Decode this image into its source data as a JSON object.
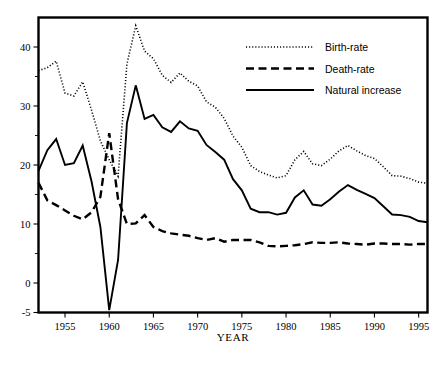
{
  "chart_data": {
    "type": "line",
    "title": "",
    "xlabel": "YEAR",
    "ylabel": "",
    "xlim": [
      1952,
      1996
    ],
    "ylim": [
      -5,
      45
    ],
    "grid": false,
    "legend_position": "top-right",
    "x": [
      1952,
      1953,
      1954,
      1955,
      1956,
      1957,
      1958,
      1959,
      1960,
      1961,
      1962,
      1963,
      1964,
      1965,
      1966,
      1967,
      1968,
      1969,
      1970,
      1971,
      1972,
      1973,
      1974,
      1975,
      1976,
      1977,
      1978,
      1979,
      1980,
      1981,
      1982,
      1983,
      1984,
      1985,
      1986,
      1987,
      1988,
      1989,
      1990,
      1991,
      1992,
      1993,
      1994,
      1995,
      1996
    ],
    "x_ticks": [
      1955,
      1960,
      1965,
      1970,
      1975,
      1980,
      1985,
      1990,
      1995
    ],
    "x_tick_labels": [
      "1955",
      "1960",
      "1965",
      "1970",
      "1975",
      "1980",
      "1985",
      "1990",
      "1995"
    ],
    "y_ticks_major": [
      40,
      30,
      20,
      10,
      0,
      -5
    ],
    "y_tick_labels": [
      "40",
      "30",
      "20",
      "10",
      "0",
      "-5"
    ],
    "y_ticks_minor": [
      35,
      25,
      15,
      5
    ],
    "series": [
      {
        "name": "Birth-rate",
        "style": "dotted",
        "values": [
          36.0,
          36.5,
          37.6,
          32.2,
          31.7,
          34.1,
          29.3,
          24.1,
          20.9,
          18.1,
          37.1,
          43.6,
          39.3,
          38.0,
          35.2,
          34.0,
          35.6,
          34.2,
          33.4,
          30.7,
          29.8,
          27.9,
          24.9,
          23.0,
          19.9,
          18.9,
          18.3,
          17.8,
          18.2,
          20.9,
          22.3,
          20.2,
          19.9,
          21.0,
          22.4,
          23.3,
          22.4,
          21.6,
          21.1,
          19.7,
          18.2,
          18.1,
          17.7,
          17.1,
          16.9
        ]
      },
      {
        "name": "Death-rate",
        "style": "dashed",
        "values": [
          17.0,
          14.0,
          13.2,
          12.3,
          11.4,
          10.8,
          12.0,
          14.6,
          25.4,
          14.2,
          10.0,
          10.1,
          11.5,
          9.5,
          8.8,
          8.4,
          8.2,
          8.0,
          7.6,
          7.3,
          7.6,
          7.0,
          7.3,
          7.3,
          7.3,
          6.9,
          6.3,
          6.2,
          6.3,
          6.4,
          6.6,
          6.9,
          6.8,
          6.8,
          6.9,
          6.7,
          6.6,
          6.5,
          6.7,
          6.7,
          6.6,
          6.6,
          6.5,
          6.6,
          6.6
        ]
      },
      {
        "name": "Natural increase",
        "style": "solid",
        "values": [
          19.0,
          22.5,
          24.4,
          20.0,
          20.3,
          23.3,
          17.2,
          9.5,
          -4.6,
          3.9,
          27.1,
          33.5,
          27.8,
          28.5,
          26.4,
          25.6,
          27.4,
          26.2,
          25.8,
          23.4,
          22.2,
          20.9,
          17.6,
          15.7,
          12.6,
          12.0,
          12.0,
          11.6,
          11.9,
          14.5,
          15.7,
          13.3,
          13.1,
          14.2,
          15.5,
          16.6,
          15.8,
          15.1,
          14.4,
          13.0,
          11.6,
          11.5,
          11.2,
          10.5,
          10.3
        ]
      }
    ]
  },
  "legend": {
    "items": [
      {
        "label": "Birth-rate",
        "style": "dotted"
      },
      {
        "label": "Death-rate",
        "style": "dashed"
      },
      {
        "label": "Natural increase",
        "style": "solid"
      }
    ]
  },
  "axis": {
    "x_title": "YEAR"
  }
}
